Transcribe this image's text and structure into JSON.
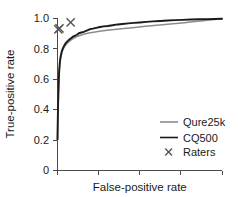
{
  "chart_data": {
    "type": "line",
    "title": "",
    "subtitle": "",
    "xlabel": "False-positive rate",
    "ylabel": "True-positive rate",
    "xlim": [
      0,
      1
    ],
    "ylim": [
      0,
      1
    ],
    "grid": false,
    "legend_position": "bottom-right",
    "x_tick_labels": [
      "",
      "",
      "",
      "",
      ""
    ],
    "x_tick_values": [
      0,
      0.25,
      0.5,
      0.75,
      1.0
    ],
    "y_tick_labels": [
      "0",
      "0.2",
      "0.4",
      "0.6",
      "0.8",
      "1.0"
    ],
    "y_tick_values": [
      0,
      0.2,
      0.4,
      0.6,
      0.8,
      1.0
    ],
    "series": [
      {
        "name": "Qure25k",
        "color": "#8c8c8c",
        "style": "line",
        "width": 1.5,
        "points": [
          [
            0.0,
            0.2
          ],
          [
            0.002,
            0.34
          ],
          [
            0.004,
            0.44
          ],
          [
            0.006,
            0.52
          ],
          [
            0.008,
            0.585
          ],
          [
            0.01,
            0.64
          ],
          [
            0.013,
            0.685
          ],
          [
            0.016,
            0.718
          ],
          [
            0.02,
            0.745
          ],
          [
            0.025,
            0.77
          ],
          [
            0.03,
            0.788
          ],
          [
            0.036,
            0.802
          ],
          [
            0.043,
            0.815
          ],
          [
            0.05,
            0.826
          ],
          [
            0.06,
            0.838
          ],
          [
            0.072,
            0.85
          ],
          [
            0.085,
            0.861
          ],
          [
            0.1,
            0.871
          ],
          [
            0.12,
            0.882
          ],
          [
            0.14,
            0.89
          ],
          [
            0.165,
            0.898
          ],
          [
            0.19,
            0.904
          ],
          [
            0.22,
            0.91
          ],
          [
            0.255,
            0.916
          ],
          [
            0.29,
            0.921
          ],
          [
            0.33,
            0.926
          ],
          [
            0.375,
            0.931
          ],
          [
            0.42,
            0.936
          ],
          [
            0.47,
            0.941
          ],
          [
            0.52,
            0.947
          ],
          [
            0.57,
            0.952
          ],
          [
            0.62,
            0.957
          ],
          [
            0.67,
            0.962
          ],
          [
            0.72,
            0.967
          ],
          [
            0.77,
            0.972
          ],
          [
            0.82,
            0.978
          ],
          [
            0.87,
            0.983
          ],
          [
            0.915,
            0.988
          ],
          [
            0.955,
            0.993
          ],
          [
            0.98,
            0.996
          ],
          [
            1.0,
            0.998
          ]
        ]
      },
      {
        "name": "CQ500",
        "color": "#1a1a1a",
        "style": "line",
        "width": 1.9,
        "points": [
          [
            0.0,
            0.205
          ],
          [
            0.002,
            0.35
          ],
          [
            0.004,
            0.455
          ],
          [
            0.006,
            0.535
          ],
          [
            0.008,
            0.6
          ],
          [
            0.01,
            0.652
          ],
          [
            0.013,
            0.696
          ],
          [
            0.016,
            0.728
          ],
          [
            0.02,
            0.755
          ],
          [
            0.025,
            0.779
          ],
          [
            0.03,
            0.797
          ],
          [
            0.036,
            0.812
          ],
          [
            0.043,
            0.826
          ],
          [
            0.05,
            0.838
          ],
          [
            0.058,
            0.848
          ],
          [
            0.068,
            0.858
          ],
          [
            0.08,
            0.869
          ],
          [
            0.092,
            0.879
          ],
          [
            0.104,
            0.886
          ],
          [
            0.118,
            0.893
          ],
          [
            0.13,
            0.903
          ],
          [
            0.145,
            0.908
          ],
          [
            0.16,
            0.912
          ],
          [
            0.178,
            0.921
          ],
          [
            0.195,
            0.929
          ],
          [
            0.215,
            0.933
          ],
          [
            0.235,
            0.938
          ],
          [
            0.258,
            0.944
          ],
          [
            0.28,
            0.948
          ],
          [
            0.305,
            0.951
          ],
          [
            0.335,
            0.956
          ],
          [
            0.365,
            0.961
          ],
          [
            0.395,
            0.964
          ],
          [
            0.43,
            0.968
          ],
          [
            0.465,
            0.971
          ],
          [
            0.5,
            0.974
          ],
          [
            0.54,
            0.978
          ],
          [
            0.58,
            0.981
          ],
          [
            0.625,
            0.984
          ],
          [
            0.67,
            0.987
          ],
          [
            0.715,
            0.989
          ],
          [
            0.76,
            0.991
          ],
          [
            0.81,
            0.993
          ],
          [
            0.86,
            0.995
          ],
          [
            0.91,
            0.996
          ],
          [
            0.955,
            0.997
          ],
          [
            1.0,
            0.998
          ]
        ]
      }
    ],
    "markers": [
      {
        "name": "Raters",
        "color": "#555555",
        "style": "x",
        "points": [
          [
            0.005,
            0.928
          ],
          [
            0.012,
            0.935
          ],
          [
            0.08,
            0.975
          ]
        ]
      }
    ],
    "legend_entries": [
      {
        "label": "Qure25k",
        "type": "line",
        "color": "#8c8c8c"
      },
      {
        "label": "CQ500",
        "type": "line",
        "color": "#1a1a1a"
      },
      {
        "label": "Raters",
        "type": "marker",
        "color": "#555555"
      }
    ]
  }
}
